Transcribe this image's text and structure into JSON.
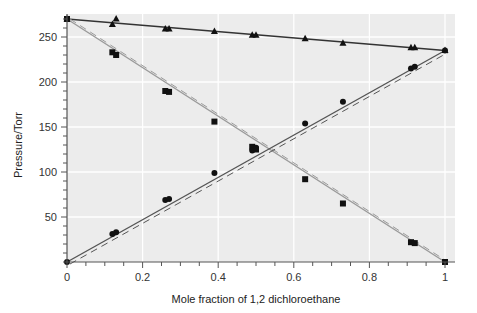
{
  "chart_data": {
    "type": "line",
    "title": "",
    "xlabel": "Mole fraction of 1,2 dichloroethane",
    "ylabel": "Pressure/Torr",
    "xlim": [
      0,
      1
    ],
    "ylim": [
      0,
      280
    ],
    "xticks": [
      0,
      0.2,
      0.4,
      0.6,
      0.8,
      1
    ],
    "xtick_labels": [
      "0",
      "0.2",
      "0.4",
      "0.6",
      "0.8",
      "1"
    ],
    "yticks": [
      50,
      100,
      150,
      200,
      250
    ],
    "ytick_labels": [
      "50",
      "100",
      "150",
      "200",
      "250"
    ],
    "grid": true,
    "legend": null,
    "x": [
      0,
      0.12,
      0.13,
      0.26,
      0.27,
      0.39,
      0.49,
      0.5,
      0.63,
      0.73,
      0.91,
      0.92,
      1.0
    ],
    "series": [
      {
        "name": "Total pressure",
        "marker": "triangle",
        "values": [
          270,
          264,
          270,
          259,
          259,
          256,
          252,
          252,
          248,
          243,
          238,
          238,
          235
        ],
        "fit_line": {
          "from": [
            0,
            270
          ],
          "to": [
            1,
            235
          ],
          "style": "solid",
          "color": "#333333"
        }
      },
      {
        "name": "Partial pressure (other component)",
        "marker": "square",
        "values": [
          270,
          233,
          230,
          190,
          189,
          156,
          128,
          125,
          92,
          65,
          22,
          21,
          0
        ],
        "fit_line": {
          "from": [
            0,
            270
          ],
          "to": [
            1,
            0
          ],
          "style": "solid",
          "color": "#9a9a9a"
        },
        "ideal_line": {
          "from": [
            0,
            270
          ],
          "to": [
            1,
            0
          ],
          "style": "dashed",
          "color": "#9a9a9a"
        }
      },
      {
        "name": "Partial pressure (1,2 dichloroethane)",
        "marker": "circle",
        "values": [
          0,
          31,
          33,
          69,
          70,
          99,
          124,
          127,
          154,
          178,
          215,
          217,
          235
        ],
        "fit_line": {
          "from": [
            0,
            0
          ],
          "to": [
            1,
            235
          ],
          "style": "solid",
          "color": "#555555"
        },
        "ideal_line": {
          "from": [
            0,
            0
          ],
          "to": [
            1,
            235
          ],
          "style": "dashed",
          "color": "#555555"
        }
      }
    ]
  }
}
